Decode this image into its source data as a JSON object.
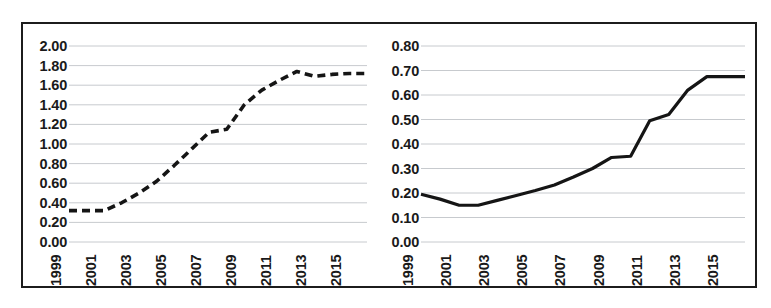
{
  "figure": {
    "background": "#ffffff",
    "border_color": "#1c1c1c",
    "grid_color": "#b9bcc2",
    "line_color": "#151515"
  },
  "chart_data": [
    {
      "id": "left",
      "type": "line",
      "title": "",
      "subtitle": "",
      "xlabel": "",
      "ylabel": "",
      "line_style": "dashed",
      "grid": true,
      "legend": "none",
      "xlim": [
        1999,
        2016
      ],
      "ylim": [
        0.0,
        2.0
      ],
      "ytick_labels": [
        "2.00",
        "1.80",
        "1.60",
        "1.40",
        "1.20",
        "1.00",
        "0.80",
        "0.60",
        "0.40",
        "0.20",
        "0.00"
      ],
      "yticks": [
        2.0,
        1.8,
        1.6,
        1.4,
        1.2,
        1.0,
        0.8,
        0.6,
        0.4,
        0.2,
        0.0
      ],
      "xtick_labels": [
        "1999",
        "2001",
        "2003",
        "2005",
        "2007",
        "2009",
        "2011",
        "2013",
        "2015"
      ],
      "xticks": [
        1999,
        2001,
        2003,
        2005,
        2007,
        2009,
        2011,
        2013,
        2015
      ],
      "x": [
        1999,
        2000,
        2001,
        2002,
        2003,
        2004,
        2005,
        2006,
        2007,
        2008,
        2009,
        2010,
        2011,
        2012,
        2013,
        2014,
        2015,
        2016
      ],
      "values": [
        0.32,
        0.32,
        0.32,
        0.4,
        0.5,
        0.62,
        0.78,
        0.95,
        1.12,
        1.15,
        1.4,
        1.55,
        1.65,
        1.74,
        1.69,
        1.71,
        1.72,
        1.72
      ]
    },
    {
      "id": "right",
      "type": "line",
      "title": "",
      "subtitle": "",
      "xlabel": "",
      "ylabel": "",
      "line_style": "solid",
      "grid": true,
      "legend": "none",
      "xlim": [
        1999,
        2016
      ],
      "ylim": [
        0.0,
        0.8
      ],
      "ytick_labels": [
        "0.80",
        "0.70",
        "0.60",
        "0.50",
        "0.40",
        "0.30",
        "0.20",
        "0.10",
        "0.00"
      ],
      "yticks": [
        0.8,
        0.7,
        0.6,
        0.5,
        0.4,
        0.3,
        0.2,
        0.1,
        0.0
      ],
      "xtick_labels": [
        "1999",
        "2001",
        "2003",
        "2005",
        "2007",
        "2009",
        "2011",
        "2013",
        "2015"
      ],
      "xticks": [
        1999,
        2001,
        2003,
        2005,
        2007,
        2009,
        2011,
        2013,
        2015
      ],
      "x": [
        1999,
        2000,
        2001,
        2002,
        2003,
        2004,
        2005,
        2006,
        2007,
        2008,
        2009,
        2010,
        2011,
        2012,
        2013,
        2014,
        2015,
        2016
      ],
      "values": [
        0.195,
        0.175,
        0.15,
        0.15,
        0.17,
        0.19,
        0.21,
        0.233,
        0.265,
        0.3,
        0.345,
        0.35,
        0.495,
        0.52,
        0.62,
        0.675,
        0.675,
        0.675
      ]
    }
  ]
}
